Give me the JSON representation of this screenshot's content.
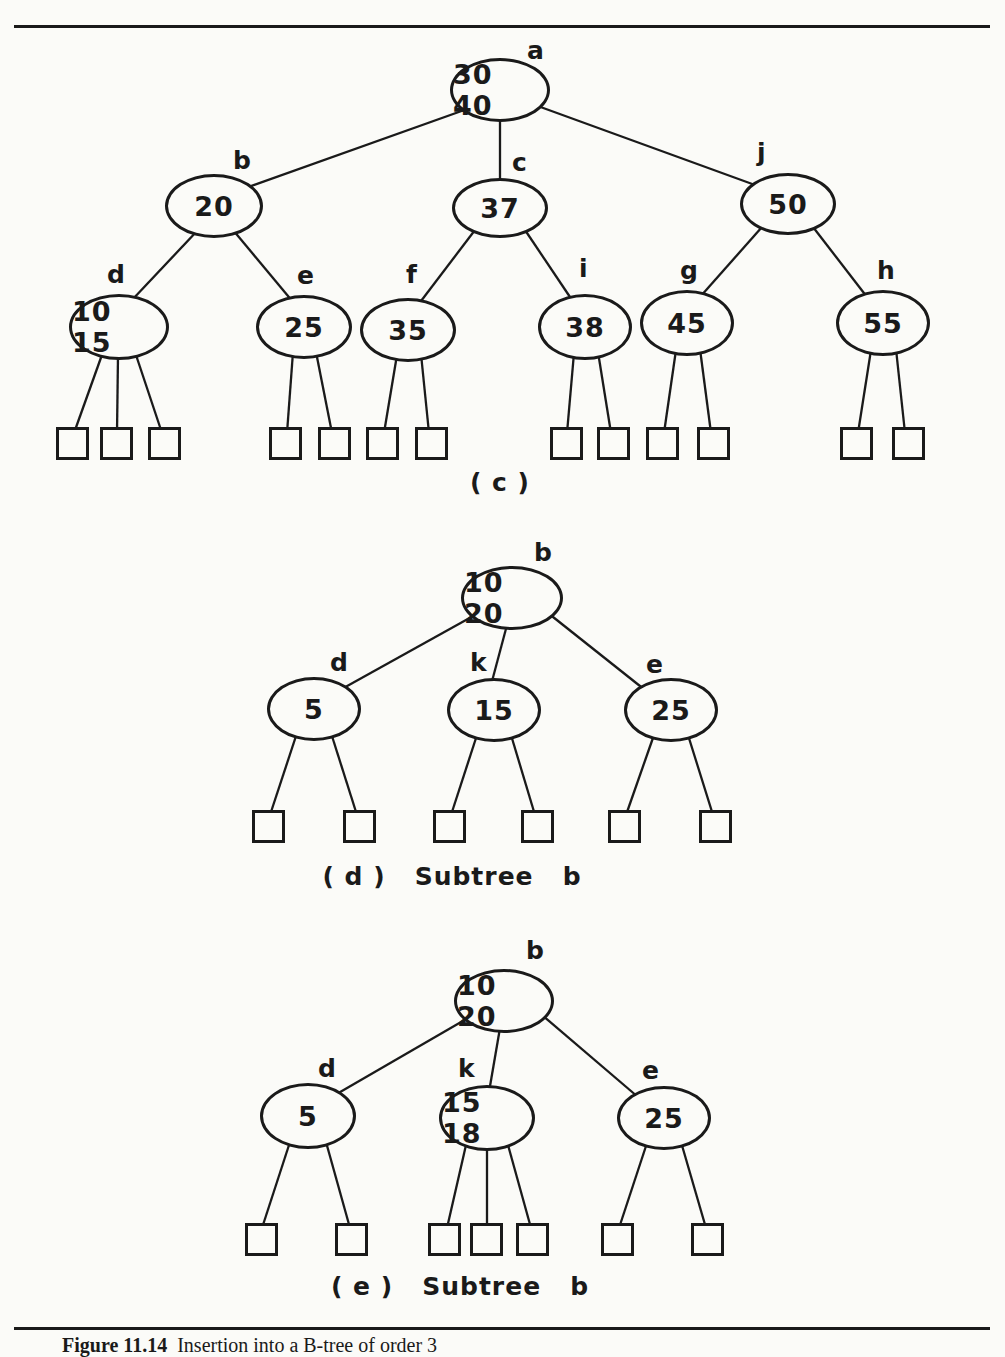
{
  "page": {
    "background": "#fbfbf8",
    "ink_color": "#1a1a1a"
  },
  "captions": {
    "tree_c": "( c )",
    "tree_d": "( d )   Subtree   b",
    "tree_e": "( e )   Subtree   b",
    "figure_label": "Figure 11.14",
    "figure_text": "Insertion into a B-tree of order 3"
  },
  "tree_c": {
    "nodes": {
      "a": {
        "label": "a",
        "keys": "30 40"
      },
      "b": {
        "label": "b",
        "keys": "20"
      },
      "c": {
        "label": "c",
        "keys": "37"
      },
      "j": {
        "label": "j",
        "keys": "50"
      },
      "d": {
        "label": "d",
        "keys": "10 15",
        "leaves": 3
      },
      "e": {
        "label": "e",
        "keys": "25",
        "leaves": 2
      },
      "f": {
        "label": "f",
        "keys": "35",
        "leaves": 2
      },
      "i": {
        "label": "i",
        "keys": "38",
        "leaves": 2
      },
      "g": {
        "label": "g",
        "keys": "45",
        "leaves": 2
      },
      "h": {
        "label": "h",
        "keys": "55",
        "leaves": 2
      }
    }
  },
  "tree_d": {
    "nodes": {
      "b": {
        "label": "b",
        "keys": "10 20"
      },
      "d": {
        "label": "d",
        "keys": "5",
        "leaves": 2
      },
      "k": {
        "label": "k",
        "keys": "15",
        "leaves": 2
      },
      "e": {
        "label": "e",
        "keys": "25",
        "leaves": 2
      }
    }
  },
  "tree_e": {
    "nodes": {
      "b": {
        "label": "b",
        "keys": "10 20"
      },
      "d": {
        "label": "d",
        "keys": "5",
        "leaves": 2
      },
      "k": {
        "label": "k",
        "keys": "15 18",
        "leaves": 3
      },
      "e": {
        "label": "e",
        "keys": "25",
        "leaves": 2
      }
    }
  }
}
